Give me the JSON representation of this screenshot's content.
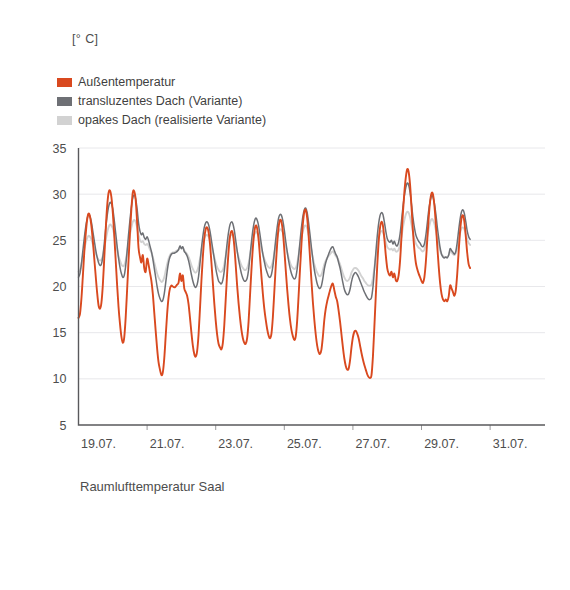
{
  "unit_label": "[° C]",
  "caption": "Raumlufttemperatur Saal",
  "colors": {
    "aussentemperatur": "#d9491f",
    "transluzent": "#6e7075",
    "opak": "#d2d2d2",
    "axis": "#59595c",
    "grid": "#e2e2e6",
    "text": "#4d4d4d"
  },
  "legend": {
    "items": [
      {
        "label": "Außentemperatur",
        "color": "#d9491f"
      },
      {
        "label": "transluzentes Dach (Variante)",
        "color": "#6e7075"
      },
      {
        "label": "opakes Dach (realisierte Variante)",
        "color": "#d2d2d2"
      }
    ]
  },
  "chart_data": {
    "type": "line",
    "title": "Raumlufttemperatur Saal",
    "xlabel": "",
    "ylabel": "[° C]",
    "ylim": [
      5,
      35
    ],
    "yticks": [
      5,
      10,
      15,
      20,
      25,
      30,
      35
    ],
    "ytick_labels": [
      "5",
      "10",
      "15",
      "20",
      "25",
      "30",
      "35"
    ],
    "xtick_labels": [
      "19.07.",
      "21.07.",
      "23.07.",
      "25.07.",
      "27.07.",
      "29.07.",
      "31.07."
    ],
    "xtick_days": [
      0,
      2,
      4,
      6,
      8,
      10,
      12
    ],
    "x_unit": "days",
    "xlim": [
      0,
      13.6
    ],
    "grid": true,
    "legend_position": "top-left",
    "sample_interval_hours": 1,
    "series": [
      {
        "name": "Außentemperatur",
        "color": "#d9491f",
        "values": [
          16.6,
          17.0,
          18.6,
          21.0,
          23.6,
          25.6,
          27.2,
          27.9,
          27.6,
          26.6,
          25.0,
          23.1,
          21.2,
          19.4,
          18.0,
          17.6,
          18.2,
          20.1,
          23.0,
          26.1,
          28.6,
          30.1,
          30.4,
          29.7,
          28.0,
          25.6,
          22.9,
          20.2,
          17.8,
          16.0,
          14.6,
          13.9,
          14.5,
          16.6,
          19.6,
          22.8,
          25.8,
          28.4,
          30.2,
          30.3,
          29.4,
          27.0,
          24.2,
          23.2,
          22.6,
          23.4,
          22.0,
          21.6,
          23.0,
          22.4,
          21.5,
          20.6,
          19.2,
          17.2,
          15.2,
          13.3,
          11.8,
          11.0,
          10.4,
          10.7,
          12.2,
          14.6,
          17.0,
          18.8,
          19.8,
          20.1,
          20.0,
          19.9,
          20.0,
          20.2,
          20.4,
          21.4,
          20.6,
          21.2,
          19.8,
          19.4,
          19.0,
          18.1,
          16.6,
          15.0,
          13.6,
          12.7,
          12.4,
          13.0,
          14.8,
          17.6,
          20.6,
          23.2,
          25.2,
          26.2,
          26.4,
          25.9,
          24.6,
          22.6,
          20.4,
          18.2,
          16.3,
          14.8,
          13.8,
          13.4,
          13.2,
          13.9,
          15.8,
          18.6,
          21.4,
          23.8,
          25.4,
          26.0,
          25.7,
          24.4,
          22.3,
          20.1,
          18.2,
          16.6,
          15.3,
          14.4,
          13.9,
          13.8,
          14.4,
          16.2,
          19.0,
          21.8,
          24.2,
          25.9,
          26.6,
          26.3,
          25.1,
          23.2,
          21.1,
          19.2,
          17.6,
          16.4,
          15.4,
          14.7,
          14.4,
          14.9,
          16.7,
          19.4,
          22.2,
          24.6,
          26.4,
          27.2,
          27.0,
          25.9,
          24.0,
          21.8,
          19.7,
          17.9,
          16.4,
          15.3,
          14.6,
          14.2,
          14.6,
          16.3,
          19.0,
          21.9,
          24.6,
          26.8,
          28.1,
          28.3,
          27.4,
          25.5,
          23.1,
          20.6,
          18.3,
          16.4,
          14.8,
          13.6,
          12.9,
          12.7,
          13.2,
          14.6,
          16.4,
          17.6,
          18.4,
          19.0,
          19.6,
          20.1,
          20.3,
          19.6,
          18.9,
          18.4,
          17.4,
          16.2,
          14.8,
          13.4,
          12.2,
          11.4,
          11.0,
          11.1,
          12.0,
          13.4,
          14.5,
          15.1,
          15.2,
          14.9,
          14.4,
          13.6,
          12.8,
          12.1,
          11.5,
          11.0,
          10.5,
          10.2,
          10.1,
          10.4,
          12.4,
          15.6,
          19.0,
          22.2,
          24.8,
          26.4,
          27.0,
          26.6,
          25.2,
          23.4,
          22.0,
          21.4,
          21.2,
          21.6,
          21.0,
          21.4,
          20.7,
          20.6,
          21.2,
          22.8,
          25.4,
          28.0,
          30.2,
          31.8,
          32.7,
          32.4,
          31.0,
          28.6,
          26.0,
          24.0,
          22.6,
          21.9,
          21.4,
          21.0,
          20.6,
          20.4,
          21.0,
          22.6,
          25.0,
          27.4,
          29.2,
          30.1,
          30.0,
          28.8,
          26.8,
          24.4,
          22.2,
          20.4,
          19.2,
          18.6,
          18.4,
          18.6,
          18.4,
          18.9,
          20.1,
          19.8,
          19.4,
          19.0,
          19.6,
          21.4,
          23.8,
          26.0,
          27.4,
          27.7,
          27.0,
          25.4,
          23.6,
          22.4,
          22.0
        ]
      },
      {
        "name": "transluzentes Dach (Variante)",
        "color": "#6e7075",
        "values": [
          21.0,
          21.4,
          22.4,
          23.8,
          25.2,
          26.4,
          27.3,
          27.8,
          27.6,
          27.0,
          26.0,
          25.0,
          24.0,
          23.2,
          22.6,
          22.3,
          22.4,
          23.2,
          24.6,
          26.2,
          27.6,
          28.6,
          29.1,
          29.0,
          28.4,
          27.2,
          25.8,
          24.4,
          23.1,
          22.1,
          21.4,
          21.0,
          21.2,
          22.2,
          23.8,
          25.6,
          27.2,
          28.6,
          29.6,
          29.9,
          29.5,
          28.4,
          26.9,
          26.0,
          25.6,
          25.8,
          25.3,
          25.1,
          25.4,
          25.0,
          24.4,
          23.8,
          23.0,
          22.0,
          21.0,
          20.0,
          19.2,
          18.7,
          18.4,
          18.5,
          19.2,
          20.4,
          21.6,
          22.6,
          23.2,
          23.5,
          23.6,
          23.6,
          23.7,
          23.8,
          24.0,
          24.4,
          24.1,
          24.3,
          23.8,
          23.6,
          23.3,
          22.8,
          22.1,
          21.3,
          20.6,
          20.1,
          19.9,
          20.2,
          21.1,
          22.5,
          24.1,
          25.4,
          26.4,
          26.9,
          27.0,
          26.7,
          26.0,
          25.0,
          24.0,
          23.0,
          22.0,
          21.2,
          20.6,
          20.4,
          20.3,
          20.7,
          21.7,
          23.2,
          24.7,
          25.9,
          26.7,
          27.0,
          26.8,
          26.1,
          25.0,
          23.9,
          22.9,
          22.1,
          21.4,
          20.9,
          20.6,
          20.6,
          20.9,
          21.8,
          23.3,
          24.8,
          26.1,
          27.0,
          27.4,
          27.2,
          26.6,
          25.6,
          24.5,
          23.5,
          22.7,
          22.0,
          21.5,
          21.1,
          21.0,
          21.3,
          22.2,
          23.6,
          25.1,
          26.4,
          27.4,
          27.8,
          27.7,
          27.1,
          26.1,
          24.9,
          23.8,
          22.8,
          22.0,
          21.4,
          21.0,
          20.8,
          21.0,
          21.9,
          23.3,
          24.9,
          26.4,
          27.6,
          28.3,
          28.5,
          28.0,
          26.9,
          25.6,
          24.2,
          22.9,
          21.8,
          21.0,
          20.3,
          19.9,
          19.8,
          20.1,
          20.9,
          21.9,
          22.6,
          23.1,
          23.5,
          23.9,
          24.2,
          24.3,
          23.9,
          23.5,
          23.2,
          22.6,
          22.0,
          21.2,
          20.4,
          19.7,
          19.3,
          19.1,
          19.2,
          19.7,
          20.5,
          21.1,
          21.4,
          21.5,
          21.3,
          21.0,
          20.6,
          20.2,
          19.8,
          19.4,
          19.1,
          18.8,
          18.6,
          18.6,
          18.8,
          19.9,
          21.7,
          23.6,
          25.4,
          26.8,
          27.7,
          28.0,
          27.8,
          27.0,
          26.0,
          25.2,
          24.9,
          24.8,
          25.0,
          24.6,
          24.9,
          24.5,
          24.4,
          24.8,
          25.7,
          27.1,
          28.6,
          29.8,
          30.7,
          31.2,
          31.0,
          30.2,
          28.9,
          27.5,
          26.4,
          25.6,
          25.2,
          24.9,
          24.7,
          24.4,
          24.3,
          24.6,
          25.5,
          26.8,
          28.2,
          29.2,
          29.8,
          29.7,
          29.0,
          27.9,
          26.5,
          25.3,
          24.2,
          23.5,
          23.2,
          23.1,
          23.2,
          23.1,
          23.4,
          24.1,
          23.9,
          23.7,
          23.5,
          23.8,
          24.8,
          26.1,
          27.3,
          28.1,
          28.3,
          27.9,
          27.0,
          26.0,
          25.4,
          25.1
        ]
      },
      {
        "name": "opakes Dach (realisierte Variante)",
        "color": "#d2d2d2",
        "values": [
          21.6,
          21.8,
          22.4,
          23.2,
          24.0,
          24.7,
          25.2,
          25.5,
          25.4,
          25.1,
          24.6,
          24.1,
          23.6,
          23.2,
          22.9,
          22.8,
          22.9,
          23.3,
          24.1,
          25.0,
          25.8,
          26.4,
          26.7,
          26.6,
          26.3,
          25.6,
          24.8,
          24.0,
          23.3,
          22.8,
          22.4,
          22.2,
          22.3,
          22.8,
          23.7,
          24.7,
          25.6,
          26.4,
          27.0,
          27.2,
          27.0,
          26.4,
          25.6,
          25.0,
          24.8,
          24.9,
          24.6,
          24.5,
          24.6,
          24.4,
          24.0,
          23.7,
          23.2,
          22.6,
          22.0,
          21.4,
          21.0,
          20.7,
          20.5,
          20.6,
          21.0,
          21.7,
          22.4,
          23.0,
          23.4,
          23.6,
          23.7,
          23.7,
          23.8,
          23.9,
          24.0,
          24.2,
          24.1,
          24.2,
          23.9,
          23.7,
          23.5,
          23.2,
          22.8,
          22.3,
          21.9,
          21.6,
          21.5,
          21.7,
          22.2,
          23.0,
          23.9,
          24.7,
          25.2,
          25.5,
          25.6,
          25.4,
          25.0,
          24.4,
          23.8,
          23.2,
          22.6,
          22.1,
          21.8,
          21.6,
          21.6,
          21.8,
          22.4,
          23.3,
          24.2,
          24.9,
          25.4,
          25.6,
          25.5,
          25.1,
          24.5,
          23.8,
          23.2,
          22.7,
          22.3,
          22.0,
          21.8,
          21.8,
          22.0,
          22.5,
          23.4,
          24.3,
          25.1,
          25.6,
          25.9,
          25.8,
          25.4,
          24.8,
          24.1,
          23.5,
          23.0,
          22.6,
          22.3,
          22.1,
          22.0,
          22.2,
          22.7,
          23.6,
          24.5,
          25.3,
          25.9,
          26.2,
          26.1,
          25.8,
          25.2,
          24.4,
          23.7,
          23.1,
          22.6,
          22.2,
          22.0,
          21.9,
          22.0,
          22.5,
          23.4,
          24.4,
          25.3,
          26.0,
          26.5,
          26.6,
          26.3,
          25.6,
          24.8,
          23.9,
          23.1,
          22.4,
          21.9,
          21.5,
          21.2,
          21.1,
          21.3,
          21.8,
          22.4,
          22.8,
          23.1,
          23.3,
          23.5,
          23.7,
          23.8,
          23.6,
          23.3,
          23.1,
          22.8,
          22.4,
          21.9,
          21.4,
          21.0,
          20.7,
          20.6,
          20.7,
          21.0,
          21.5,
          21.8,
          22.0,
          22.0,
          21.9,
          21.7,
          21.4,
          21.1,
          20.9,
          20.6,
          20.4,
          20.2,
          20.1,
          20.1,
          20.2,
          20.9,
          22.0,
          23.2,
          24.3,
          25.2,
          25.8,
          26.0,
          25.9,
          25.4,
          24.8,
          24.3,
          24.1,
          24.0,
          24.1,
          23.9,
          24.1,
          23.8,
          23.8,
          24.0,
          24.6,
          25.4,
          26.4,
          27.2,
          27.8,
          28.1,
          28.0,
          27.5,
          26.7,
          25.9,
          25.2,
          24.7,
          24.4,
          24.2,
          24.1,
          23.9,
          23.8,
          24.0,
          24.6,
          25.4,
          26.2,
          26.9,
          27.3,
          27.2,
          26.8,
          26.1,
          25.3,
          24.6,
          23.9,
          23.5,
          23.3,
          23.2,
          23.2,
          23.2,
          23.4,
          23.8,
          23.7,
          23.5,
          23.4,
          23.6,
          24.2,
          25.0,
          25.8,
          26.3,
          26.4,
          26.2,
          25.7,
          25.1,
          24.7,
          24.5
        ]
      }
    ]
  }
}
